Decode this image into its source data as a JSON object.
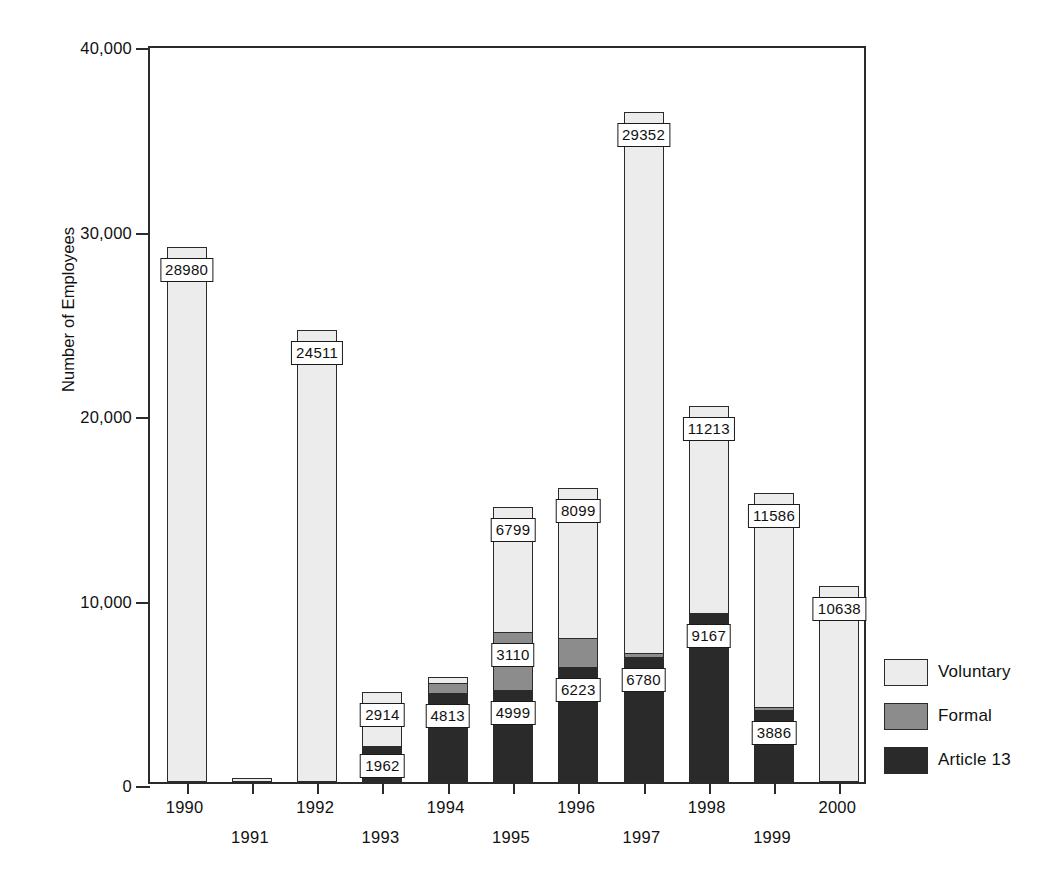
{
  "chart_data": {
    "type": "bar",
    "title": "",
    "subtitle": "",
    "xlabel": "",
    "ylabel": "Number of Employees",
    "stacked": true,
    "grid": false,
    "legend_position": "right",
    "ylim": [
      0,
      40000
    ],
    "ytick_values": [
      0,
      10000,
      20000,
      30000,
      40000
    ],
    "ytick_labels": [
      "0",
      "10,000",
      "20,000",
      "30,000",
      "40,000"
    ],
    "categories": [
      "1990",
      "1991",
      "1992",
      "1993",
      "1994",
      "1995",
      "1996",
      "1997",
      "1998",
      "1999",
      "2000"
    ],
    "series": [
      {
        "name": "Article 13",
        "color": "#2a2a2a",
        "values": [
          0,
          0,
          0,
          1962,
          4813,
          4999,
          6223,
          6780,
          9167,
          3886,
          0
        ],
        "labels": [
          "",
          "",
          "",
          "1962",
          "4813",
          "4999",
          "6223",
          "6780",
          "9167",
          "3886",
          ""
        ]
      },
      {
        "name": "Formal",
        "color": "#8c8c8c",
        "values": [
          0,
          0,
          0,
          0,
          550,
          3110,
          1600,
          200,
          0,
          180,
          0
        ],
        "labels": [
          "",
          "",
          "",
          "",
          "",
          "3110",
          "",
          "",
          "",
          "",
          ""
        ]
      },
      {
        "name": "Voluntary",
        "color": "#ececec",
        "values": [
          28980,
          200,
          24511,
          2914,
          330,
          6799,
          8099,
          29352,
          11213,
          11586,
          10638
        ],
        "labels": [
          "28980",
          "",
          "24511",
          "2914",
          "",
          "6799",
          "8099",
          "29352",
          "11213",
          "11586",
          "10638"
        ]
      }
    ],
    "totals": [
      28980,
      200,
      24511,
      4876,
      5693,
      14908,
      15922,
      36332,
      20380,
      15652,
      10638
    ]
  },
  "legend": {
    "items": [
      {
        "label": "Voluntary",
        "key": "voluntary"
      },
      {
        "label": "Formal",
        "key": "formal"
      },
      {
        "label": "Article 13",
        "key": "article"
      }
    ]
  }
}
